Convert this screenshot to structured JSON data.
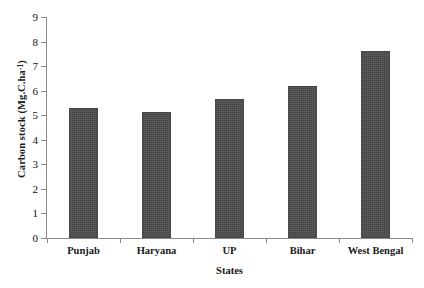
{
  "chart_data": {
    "type": "bar",
    "title": "",
    "categories": [
      "Punjab",
      "Haryana",
      "UP",
      "Bihar",
      "West Bengal"
    ],
    "values": [
      5.3,
      5.15,
      5.65,
      6.2,
      7.6
    ],
    "xlabel": "States",
    "ylabel_text": "Carbon stock (Mg.C.ha",
    "ylabel_sup": "-1",
    "ylabel_tail": ")",
    "ylabel_full": "Carbon stock (Mg.C.ha-1)",
    "ylim": [
      0,
      9
    ],
    "ytick_step": 1,
    "yticks": [
      "0",
      "1",
      "2",
      "3",
      "4",
      "5",
      "6",
      "7",
      "8",
      "9"
    ],
    "grid": false,
    "legend": false,
    "bar_color": "#4d4d4d",
    "axis_color": "#8a8a8a",
    "background": "#ffffff"
  }
}
